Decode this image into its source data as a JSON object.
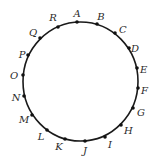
{
  "diagram": {
    "type": "circle-with-labeled-points",
    "circle": {
      "cx": 80.5,
      "cy": 81.5,
      "rx": 57.5,
      "ry": 59.5,
      "stroke": "#1a1a1a"
    },
    "point_color": "#111111",
    "points": [
      {
        "label": "A",
        "x": 77,
        "y": 22,
        "lx": 77,
        "ly": 17,
        "anchor": "middle"
      },
      {
        "label": "B",
        "x": 97,
        "y": 24,
        "lx": 101,
        "ly": 20,
        "anchor": "middle"
      },
      {
        "label": "C",
        "x": 115,
        "y": 33,
        "lx": 119,
        "ly": 33,
        "anchor": "start"
      },
      {
        "label": "D",
        "x": 129,
        "y": 48,
        "lx": 131,
        "ly": 52,
        "anchor": "start"
      },
      {
        "label": "E",
        "x": 137,
        "y": 68,
        "lx": 140,
        "ly": 73,
        "anchor": "start"
      },
      {
        "label": "F",
        "x": 138,
        "y": 88,
        "lx": 141,
        "ly": 94,
        "anchor": "start"
      },
      {
        "label": "G",
        "x": 133,
        "y": 108,
        "lx": 137,
        "ly": 116,
        "anchor": "start"
      },
      {
        "label": "H",
        "x": 121,
        "y": 125,
        "lx": 124,
        "ly": 134,
        "anchor": "start"
      },
      {
        "label": "I",
        "x": 105,
        "y": 137,
        "lx": 108,
        "ly": 148,
        "anchor": "start"
      },
      {
        "label": "J",
        "x": 85,
        "y": 141,
        "lx": 85,
        "ly": 154,
        "anchor": "middle"
      },
      {
        "label": "K",
        "x": 65,
        "y": 139,
        "lx": 59,
        "ly": 150,
        "anchor": "middle"
      },
      {
        "label": "L",
        "x": 47,
        "y": 130,
        "lx": 41,
        "ly": 140,
        "anchor": "middle"
      },
      {
        "label": "M",
        "x": 32,
        "y": 115,
        "lx": 24,
        "ly": 123,
        "anchor": "middle"
      },
      {
        "label": "N",
        "x": 24,
        "y": 96,
        "lx": 16,
        "ly": 101,
        "anchor": "middle"
      },
      {
        "label": "O",
        "x": 23,
        "y": 75,
        "lx": 14,
        "ly": 79,
        "anchor": "middle"
      },
      {
        "label": "P",
        "x": 28,
        "y": 55,
        "lx": 22,
        "ly": 58,
        "anchor": "middle"
      },
      {
        "label": "Q",
        "x": 40,
        "y": 38,
        "lx": 33,
        "ly": 36,
        "anchor": "middle"
      },
      {
        "label": "R",
        "x": 58,
        "y": 27,
        "lx": 53,
        "ly": 21,
        "anchor": "middle"
      }
    ]
  }
}
